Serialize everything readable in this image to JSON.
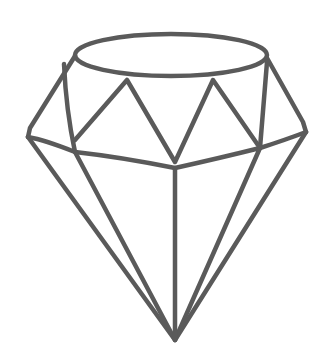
{
  "image": {
    "subject": "diamond-sketch",
    "description": "Hand-drawn pencil sketch of a faceted diamond",
    "stroke_color": "#4a4a4a",
    "background_color": "#ffffff"
  }
}
